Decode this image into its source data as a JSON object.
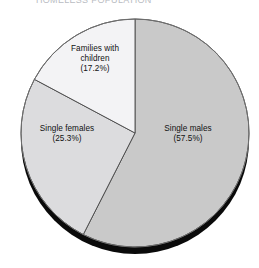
{
  "title": {
    "text": "HOMELESS POPULATION",
    "clipped": true
  },
  "chart_data": {
    "type": "pie",
    "title": "HOMELESS POPULATION",
    "xlabel": "",
    "ylabel": "",
    "legend_position": "none",
    "labels_inside_slices": true,
    "start_angle_deg": 0,
    "direction": "clockwise",
    "categories": [
      "Single males",
      "Single females",
      "Families with children"
    ],
    "values": [
      57.5,
      25.3,
      17.2
    ],
    "value_unit": "%",
    "slices": [
      {
        "name": "Single males",
        "value": 57.5,
        "value_label": "(57.5%)",
        "label_line1": "Single males",
        "label_line2": "(57.5%)",
        "color": "#c9c9c9",
        "start_deg": 0,
        "end_deg": 207
      },
      {
        "name": "Single females",
        "value": 25.3,
        "value_label": "(25.3%)",
        "label_line1": "Single females",
        "label_line2": "(25.3%)",
        "color": "#dcdcde",
        "start_deg": 207,
        "end_deg": 298.1
      },
      {
        "name": "Families with children",
        "value": 17.2,
        "value_label": "(17.2%)",
        "label_line1": "Families with",
        "label_line2": "children",
        "label_line3": "(17.2%)",
        "color": "#f3f3f5",
        "start_deg": 298.1,
        "end_deg": 360
      }
    ],
    "style": {
      "outline_color": "#4a4a4a",
      "shadow_color": "#0a0a0a",
      "background": "#ffffff",
      "three_d_shadow": true
    }
  }
}
